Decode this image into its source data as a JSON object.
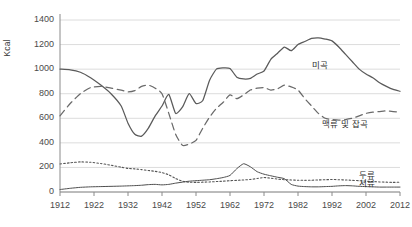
{
  "chart_data": {
    "type": "line",
    "title": "",
    "xlabel": "",
    "ylabel": "Kcal",
    "xlim": [
      1912,
      2012
    ],
    "ylim": [
      0,
      1400
    ],
    "grid": true,
    "legend_position": "inline-right",
    "xticks": [
      1912,
      1922,
      1932,
      1942,
      1952,
      1962,
      1972,
      1982,
      1992,
      2002,
      2012
    ],
    "yticks": [
      0,
      200,
      400,
      600,
      800,
      1000,
      1200,
      1400
    ],
    "series": [
      {
        "name": "미곡",
        "style": "solid",
        "color": "#5a5a5a",
        "label_x": 1986,
        "label_y": 1045,
        "x": [
          1912,
          1915,
          1918,
          1921,
          1924,
          1927,
          1930,
          1932,
          1934,
          1936,
          1938,
          1940,
          1942,
          1944,
          1946,
          1948,
          1950,
          1952,
          1954,
          1956,
          1958,
          1960,
          1962,
          1964,
          1966,
          1968,
          1970,
          1972,
          1974,
          1976,
          1978,
          1980,
          1982,
          1984,
          1986,
          1988,
          1990,
          1992,
          1994,
          1996,
          1998,
          2000,
          2002,
          2004,
          2006,
          2008,
          2010,
          2012
        ],
        "values": [
          1000,
          995,
          975,
          930,
          870,
          800,
          700,
          560,
          470,
          455,
          520,
          620,
          700,
          795,
          640,
          690,
          800,
          720,
          745,
          910,
          1000,
          1010,
          1005,
          935,
          920,
          925,
          960,
          985,
          1080,
          1130,
          1180,
          1150,
          1200,
          1225,
          1250,
          1255,
          1245,
          1230,
          1180,
          1120,
          1060,
          1000,
          960,
          930,
          890,
          860,
          835,
          820
        ]
      },
      {
        "name": "맥류 및 잡곡",
        "style": "dashed",
        "color": "#6a6a6a",
        "label_x": 1989,
        "label_y": 565,
        "x": [
          1912,
          1915,
          1918,
          1921,
          1924,
          1927,
          1930,
          1932,
          1934,
          1936,
          1938,
          1940,
          1942,
          1944,
          1946,
          1948,
          1950,
          1952,
          1954,
          1956,
          1958,
          1960,
          1962,
          1964,
          1966,
          1968,
          1970,
          1972,
          1974,
          1976,
          1978,
          1980,
          1982,
          1984,
          1986,
          1988,
          1990,
          1992,
          1994,
          1996,
          1998,
          2000,
          2002,
          2004,
          2006,
          2008,
          2010,
          2012
        ],
        "values": [
          620,
          720,
          800,
          850,
          860,
          845,
          830,
          815,
          825,
          860,
          870,
          845,
          800,
          640,
          470,
          380,
          390,
          420,
          520,
          610,
          680,
          730,
          790,
          760,
          790,
          830,
          845,
          850,
          830,
          840,
          870,
          855,
          830,
          760,
          700,
          640,
          600,
          590,
          585,
          590,
          600,
          620,
          640,
          650,
          655,
          660,
          655,
          650
        ]
      },
      {
        "name": "두류",
        "style": "dotted",
        "color": "#555555",
        "label_x": 2000,
        "label_y": 150,
        "x": [
          1912,
          1915,
          1918,
          1921,
          1924,
          1927,
          1930,
          1932,
          1934,
          1936,
          1938,
          1940,
          1942,
          1944,
          1946,
          1948,
          1950,
          1952,
          1954,
          1956,
          1958,
          1960,
          1962,
          1964,
          1966,
          1968,
          1970,
          1972,
          1974,
          1976,
          1978,
          1980,
          1982,
          1984,
          1986,
          1988,
          1990,
          1992,
          1994,
          1996,
          1998,
          2000,
          2002,
          2004,
          2006,
          2008,
          2010,
          2012
        ],
        "values": [
          228,
          238,
          245,
          242,
          232,
          218,
          202,
          192,
          188,
          182,
          175,
          168,
          158,
          140,
          110,
          88,
          80,
          78,
          80,
          82,
          85,
          88,
          92,
          95,
          98,
          102,
          110,
          118,
          112,
          105,
          100,
          98,
          96,
          95,
          96,
          98,
          100,
          102,
          100,
          98,
          95,
          92,
          88,
          85,
          82,
          80,
          78,
          80
        ]
      },
      {
        "name": "서류",
        "style": "solid-thin",
        "color": "#4f4f4f",
        "label_x": 2000,
        "label_y": 78,
        "x": [
          1912,
          1915,
          1918,
          1921,
          1924,
          1927,
          1930,
          1932,
          1934,
          1936,
          1938,
          1940,
          1942,
          1944,
          1946,
          1948,
          1950,
          1952,
          1954,
          1956,
          1958,
          1960,
          1962,
          1964,
          1966,
          1968,
          1970,
          1972,
          1974,
          1976,
          1978,
          1980,
          1982,
          1984,
          1986,
          1988,
          1990,
          1992,
          1994,
          1996,
          1998,
          2000,
          2002,
          2004,
          2006,
          2008,
          2010,
          2012
        ],
        "values": [
          20,
          30,
          38,
          42,
          44,
          46,
          48,
          50,
          52,
          55,
          60,
          62,
          58,
          62,
          72,
          80,
          88,
          92,
          96,
          100,
          108,
          118,
          135,
          190,
          230,
          205,
          165,
          145,
          132,
          120,
          108,
          62,
          48,
          44,
          42,
          42,
          44,
          46,
          50,
          52,
          50,
          46,
          44,
          42,
          40,
          40,
          40,
          40
        ]
      }
    ]
  },
  "axis": {
    "ylabel": "Kcal",
    "yticks": [
      "1400",
      "1200",
      "1000",
      "800",
      "600",
      "400",
      "200",
      "0"
    ],
    "xticks": [
      "1912",
      "1922",
      "1932",
      "1942",
      "1952",
      "1962",
      "1972",
      "1982",
      "1992",
      "2002",
      "2012"
    ]
  },
  "series_labels": {
    "rice": "미곡",
    "barley_misc": "맥류 및 잡곡",
    "legumes": "두류",
    "tubers": "서류"
  },
  "colors": {
    "line": "#5a5a5a",
    "grid": "#dcdcdc",
    "axis": "#8a8a8a",
    "text": "#444444"
  }
}
